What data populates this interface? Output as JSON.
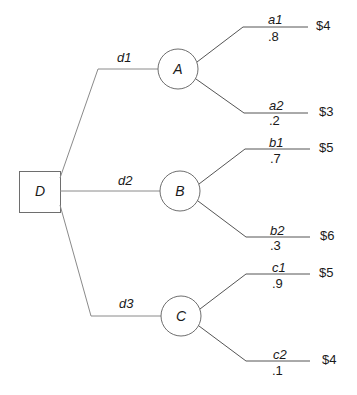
{
  "diagram": {
    "type": "decision-tree",
    "decision_node": {
      "label": "D"
    },
    "branches": [
      {
        "decision": "d1",
        "chance_node": "A",
        "outcomes": [
          {
            "label": "a1",
            "probability": ".8",
            "payoff": "$4"
          },
          {
            "label": "a2",
            "probability": ".2",
            "payoff": "$3"
          }
        ]
      },
      {
        "decision": "d2",
        "chance_node": "B",
        "outcomes": [
          {
            "label": "b1",
            "probability": ".7",
            "payoff": "$5"
          },
          {
            "label": "b2",
            "probability": ".3",
            "payoff": "$6"
          }
        ]
      },
      {
        "decision": "d3",
        "chance_node": "C",
        "outcomes": [
          {
            "label": "c1",
            "probability": ".9",
            "payoff": "$5"
          },
          {
            "label": "c2",
            "probability": ".1",
            "payoff": "$4"
          }
        ]
      }
    ],
    "colors": {
      "line": "#6e6e6e",
      "text": "#1a1a1a"
    }
  }
}
